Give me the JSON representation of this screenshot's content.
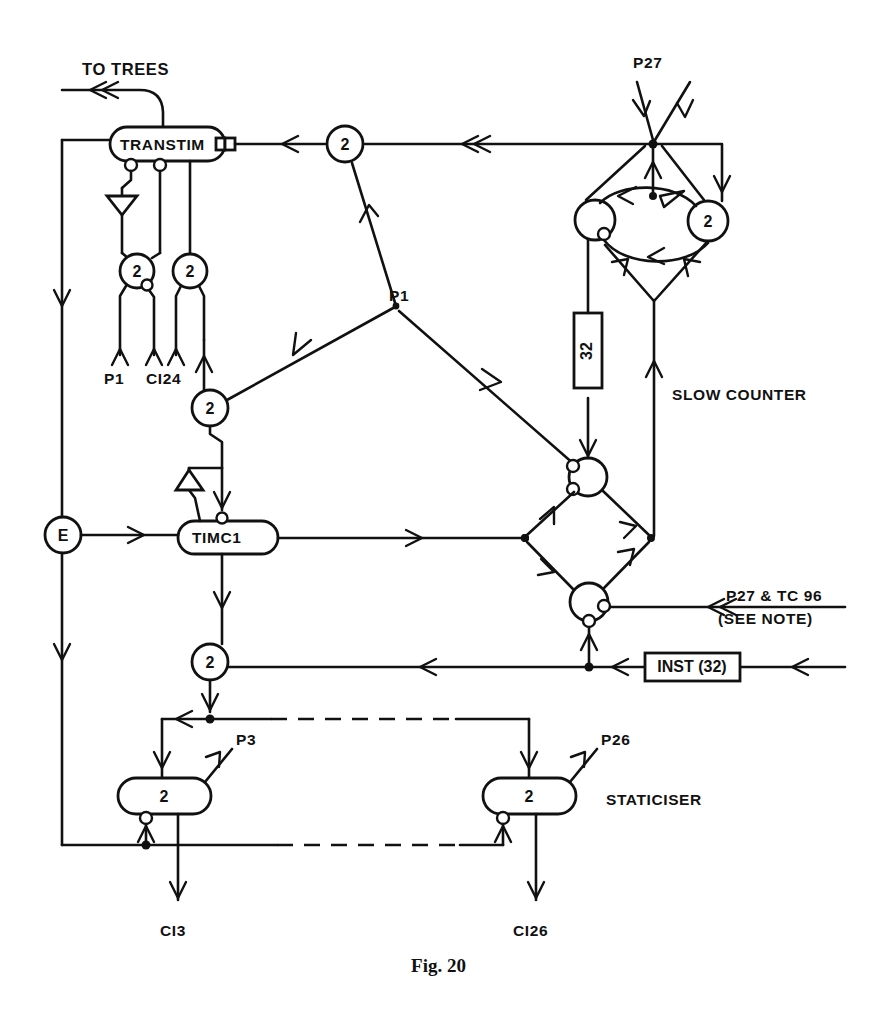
{
  "figure": {
    "caption": "Fig. 20",
    "background_color": "#ffffff",
    "ink_color": "#111111"
  },
  "labels": {
    "to_trees": "TO TREES",
    "transtim": "TRANSTIM",
    "p27_top": "P27",
    "p1_left_input": "P1",
    "ci24_input": "CI24",
    "p1_junction": "P1",
    "slow_counter": "SLOW COUNTER",
    "counter_box_32": "32",
    "timc1": "TIMC1",
    "e_node": "E",
    "p27_tc96_line1": "P27 & TC 96",
    "p27_tc96_line2": "(SEE NOTE)",
    "inst_32": "INST (32)",
    "p3": "P3",
    "p26": "P26",
    "staticiser": "STATICISER",
    "ci3": "CI3",
    "ci26": "CI26"
  },
  "gate_values": {
    "transtim_gate_a": "2",
    "transtim_gate_b": "2",
    "top_bus_gate": "2",
    "mid_gate": "2",
    "slow_counter_gate": "2",
    "timc1_out_gate": "2",
    "staticiser_left": "2",
    "staticiser_right": "2"
  }
}
